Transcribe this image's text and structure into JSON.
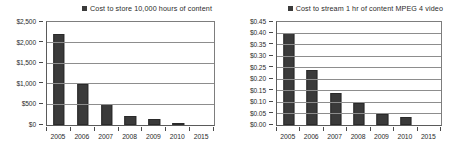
{
  "chart_data": [
    {
      "id": "store-cost",
      "type": "bar",
      "title": "",
      "legend": [
        "Cost to store 10,000 hours of content"
      ],
      "legend_position": "top-right",
      "legend_marker": "square-marker",
      "categories": [
        "2005",
        "2006",
        "2007",
        "2008",
        "2009",
        "2010",
        "2015"
      ],
      "values": [
        2200,
        1000,
        500,
        230,
        140,
        60,
        0
      ],
      "xlabel": "",
      "ylabel": "",
      "ylim": [
        0,
        2500
      ],
      "yticks": [
        0,
        500,
        1000,
        1500,
        2000,
        2500
      ],
      "ytick_labels": [
        "$0",
        "$500",
        "$1,000",
        "$1,500",
        "$2,000",
        "$2,500"
      ],
      "grid": true,
      "bar_color": "#3a3a3a"
    },
    {
      "id": "stream-cost",
      "type": "bar",
      "title": "",
      "legend": [
        "Cost to stream 1 hr of content MPEG 4 video"
      ],
      "legend_position": "top-right",
      "legend_marker": "square-marker",
      "categories": [
        "2005",
        "2006",
        "2007",
        "2008",
        "2009",
        "2010",
        "2015"
      ],
      "values": [
        0.4,
        0.24,
        0.14,
        0.095,
        0.05,
        0.033,
        0
      ],
      "xlabel": "",
      "ylabel": "",
      "ylim": [
        0,
        0.45
      ],
      "yticks": [
        0,
        0.05,
        0.1,
        0.15,
        0.2,
        0.25,
        0.3,
        0.35,
        0.4,
        0.45
      ],
      "ytick_labels": [
        "$0.00",
        "$0.05",
        "$0.10",
        "$0.15",
        "$0.20",
        "$0.25",
        "$0.30",
        "$0.35",
        "$0.40",
        "$0.45"
      ],
      "grid": true,
      "bar_color": "#3a3a3a"
    }
  ]
}
